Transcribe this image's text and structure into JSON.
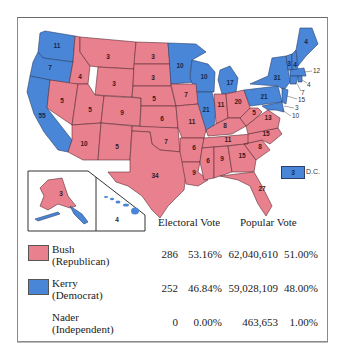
{
  "colors": {
    "republican": "#e8808e",
    "democrat": "#4a86d8"
  },
  "states": {
    "WA": "11",
    "OR": "7",
    "CA": "55",
    "ID": "4",
    "NV": "5",
    "MT": "3",
    "WY": "3",
    "UT": "5",
    "AZ": "10",
    "CO": "9",
    "NM": "5",
    "ND": "3",
    "SD": "3",
    "NE": "5",
    "KS": "6",
    "OK": "7",
    "TX": "34",
    "MN": "10",
    "IA": "7",
    "MO": "11",
    "AR": "6",
    "LA": "9",
    "WI": "10",
    "IL": "21",
    "MI": "17",
    "IN": "11",
    "OH": "20",
    "KY": "8",
    "TN": "11",
    "MS": "6",
    "AL": "9",
    "GA": "15",
    "FL": "27",
    "SC": "8",
    "NC": "15",
    "VA": "13",
    "WV": "5",
    "PA": "21",
    "NY": "31",
    "VT": "3",
    "NH": "4",
    "ME": "4",
    "MA": "12",
    "RI": "4",
    "CT": "7",
    "NJ": "15",
    "DE": "3",
    "MD": "10",
    "AK": "3",
    "HI": "4"
  },
  "dc": {
    "value": "3",
    "label": "D.C."
  },
  "table": {
    "headers": {
      "electoral": "Electoral Vote",
      "popular": "Popular Vote"
    },
    "rows": [
      {
        "name": "Bush",
        "party": "(Republican)",
        "electoral_votes": "286",
        "electoral_pct": "53.16%",
        "popular_votes": "62,040,610",
        "popular_pct": "51.00%"
      },
      {
        "name": "Kerry",
        "party": "(Democrat)",
        "electoral_votes": "252",
        "electoral_pct": "46.84%",
        "popular_votes": "59,028,109",
        "popular_pct": "48.00%"
      },
      {
        "name": "Nader",
        "party": "(Independent)",
        "electoral_votes": "0",
        "electoral_pct": "0.00%",
        "popular_votes": "463,653",
        "popular_pct": "1.00%"
      }
    ]
  }
}
